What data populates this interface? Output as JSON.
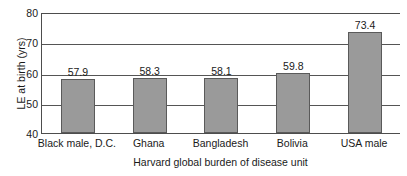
{
  "chart_data": {
    "type": "bar",
    "title": "",
    "xlabel": "Harvard global burden of disease unit",
    "ylabel": "LE at birth (yrs)",
    "categories": [
      "Black male, D.C.",
      "Ghana",
      "Bangladesh",
      "Bolivia",
      "USA male"
    ],
    "values": [
      57.9,
      58.3,
      58.1,
      59.8,
      73.4
    ],
    "value_labels": [
      "57.9",
      "58.3",
      "58.1",
      "59.8",
      "73.4"
    ],
    "ylim": [
      40,
      80
    ],
    "yticks": [
      80,
      70,
      60,
      50,
      40
    ],
    "ytick_labels": [
      "80",
      "70",
      "60",
      "50",
      "40"
    ],
    "grid": true,
    "grid_axis": "y",
    "legend": false,
    "legend_position": "none",
    "bar_color": "#9a9a9a",
    "bar_border_color": "#5a5a5a",
    "axis_color": "#4d4d4d",
    "background_color": "#ffffff",
    "text_color": "#1a1a1a"
  }
}
